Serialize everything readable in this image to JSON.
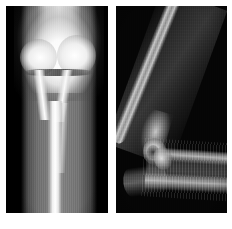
{
  "figure": {
    "background_color": "#ffffff",
    "width": 232,
    "height": 229,
    "modality": "radiograph",
    "panel_count": 2,
    "layout": "two-panels-side-by-side"
  },
  "panels": [
    {
      "id": "ap",
      "position": "left",
      "view": "anteroposterior",
      "anatomy": "elbow and proximal forearm",
      "orientation": "vertical",
      "background_color": "#000000",
      "bone_color": "#ffffff",
      "soft_tissue_color": "#8a8a8a",
      "features": [
        "distal humerus metaphysis",
        "medial condyle",
        "lateral condyle",
        "physis / joint line lucency",
        "proximal radius",
        "proximal ulna",
        "forearm diaphysis",
        "soft tissue envelope"
      ],
      "exposure": "overexposed at the distal humerus"
    },
    {
      "id": "lateral",
      "position": "right",
      "view": "lateral",
      "anatomy": "flexed elbow with forearm",
      "orientation": "vertical",
      "background_color": "#050505",
      "bone_color": "#cfcfcf",
      "soft_tissue_color": "#4a4a4a",
      "features": [
        "humeral shaft oblique from upper right",
        "distal humeral flare",
        "capitellum / trochlea",
        "olecranon of the ulna",
        "radial cortex of the forearm",
        "ulnar cortex of the forearm",
        "splint / cast striations",
        "proximal forearm soft tissue"
      ],
      "exposure": "darker, underexposed"
    }
  ]
}
